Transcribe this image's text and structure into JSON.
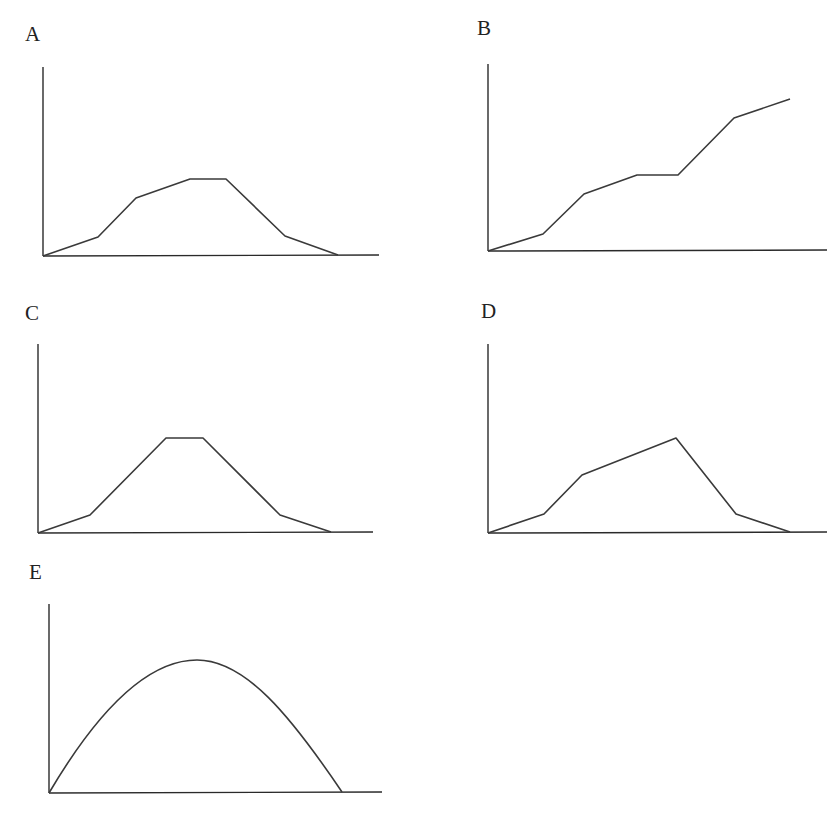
{
  "figure": {
    "background": "#ffffff",
    "line_color": "#3a3a3a",
    "axis_color": "#2a2a2a",
    "line_width": 1.6,
    "axis_width": 1.4
  },
  "panels": [
    {
      "id": "A",
      "label": "A",
      "label_pos": [
        25,
        26
      ],
      "origin": [
        43,
        256
      ],
      "y_axis_top": [
        43,
        67
      ],
      "x_axis_end": [
        379,
        255
      ],
      "shape": "polyline",
      "points": [
        [
          43,
          256
        ],
        [
          98,
          237
        ],
        [
          136,
          198
        ],
        [
          190,
          179
        ],
        [
          226,
          179
        ],
        [
          285,
          236
        ],
        [
          338,
          255
        ]
      ]
    },
    {
      "id": "B",
      "label": "B",
      "label_pos": [
        477,
        20
      ],
      "origin": [
        488,
        251
      ],
      "y_axis_top": [
        488,
        64
      ],
      "x_axis_end": [
        827,
        250
      ],
      "shape": "polyline",
      "points": [
        [
          488,
          251
        ],
        [
          543,
          234
        ],
        [
          584,
          194
        ],
        [
          637,
          175
        ],
        [
          678,
          175
        ],
        [
          734,
          118
        ],
        [
          790,
          99
        ]
      ]
    },
    {
      "id": "C",
      "label": "C",
      "label_pos": [
        25,
        305
      ],
      "origin": [
        38,
        533
      ],
      "y_axis_top": [
        38,
        344
      ],
      "x_axis_end": [
        373,
        532
      ],
      "shape": "polyline",
      "points": [
        [
          38,
          533
        ],
        [
          90,
          515
        ],
        [
          166,
          438
        ],
        [
          203,
          438
        ],
        [
          280,
          515
        ],
        [
          331,
          532
        ]
      ]
    },
    {
      "id": "D",
      "label": "D",
      "label_pos": [
        481,
        303
      ],
      "origin": [
        488,
        533
      ],
      "y_axis_top": [
        488,
        344
      ],
      "x_axis_end": [
        827,
        532
      ],
      "shape": "polyline",
      "points": [
        [
          488,
          533
        ],
        [
          544,
          514
        ],
        [
          582,
          475
        ],
        [
          676,
          438
        ],
        [
          736,
          514
        ],
        [
          790,
          532
        ]
      ]
    },
    {
      "id": "E",
      "label": "E",
      "label_pos": [
        29,
        564
      ],
      "origin": [
        49,
        793
      ],
      "y_axis_top": [
        49,
        604
      ],
      "x_axis_end": [
        382,
        792
      ],
      "shape": "curve",
      "path": "M49,793 C95,715 145,660 197,660 C245,660 290,715 342,792"
    }
  ],
  "chart_data": [
    {
      "type": "line",
      "title": "A",
      "xlabel": "",
      "ylabel": "",
      "grid": false,
      "description": "Rises slowly, then steeply, levels at a plateau, then falls steeply and tapers to zero",
      "x": [
        0,
        0.17,
        0.28,
        0.44,
        0.55,
        0.73,
        0.88
      ],
      "values": [
        0,
        0.1,
        0.3,
        0.4,
        0.4,
        0.11,
        0.01
      ],
      "xlim": [
        0,
        1
      ],
      "ylim": [
        0,
        1
      ]
    },
    {
      "type": "line",
      "title": "B",
      "xlabel": "",
      "ylabel": "",
      "grid": false,
      "description": "Monotonically increasing in steps: slow rise, steeper rise, plateau, steep rise, slow rise",
      "x": [
        0,
        0.16,
        0.28,
        0.44,
        0.56,
        0.73,
        0.89
      ],
      "values": [
        0,
        0.09,
        0.31,
        0.41,
        0.41,
        0.71,
        0.82
      ],
      "xlim": [
        0,
        1
      ],
      "ylim": [
        0,
        1
      ]
    },
    {
      "type": "line",
      "title": "C",
      "xlabel": "",
      "ylabel": "",
      "grid": false,
      "description": "Symmetric trapezoid: slow rise, steep rise, short plateau, steep fall, slow fall to zero",
      "x": [
        0,
        0.16,
        0.38,
        0.49,
        0.72,
        0.87
      ],
      "values": [
        0,
        0.1,
        0.5,
        0.5,
        0.1,
        0.01
      ],
      "xlim": [
        0,
        1
      ],
      "ylim": [
        0,
        1
      ]
    },
    {
      "type": "line",
      "title": "D",
      "xlabel": "",
      "ylabel": "",
      "grid": false,
      "description": "Slow rise, steeper rise, gradual rise to a peak, steep fall, slow fall to zero",
      "x": [
        0,
        0.17,
        0.28,
        0.56,
        0.73,
        0.89
      ],
      "values": [
        0,
        0.1,
        0.31,
        0.5,
        0.1,
        0.01
      ],
      "xlim": [
        0,
        1
      ],
      "ylim": [
        0,
        1
      ]
    },
    {
      "type": "line",
      "title": "E",
      "xlabel": "",
      "ylabel": "",
      "grid": false,
      "description": "Smooth parabola-like curve starting at origin, peaking near the middle, returning to zero",
      "x": [
        0,
        0.1,
        0.2,
        0.3,
        0.44,
        0.55,
        0.7,
        0.8,
        0.88
      ],
      "values": [
        0,
        0.25,
        0.47,
        0.63,
        0.7,
        0.67,
        0.5,
        0.3,
        0.01
      ],
      "xlim": [
        0,
        1
      ],
      "ylim": [
        0,
        1
      ]
    }
  ]
}
